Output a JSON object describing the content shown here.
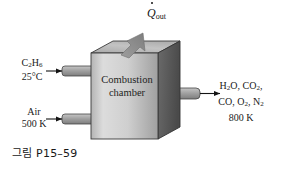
{
  "figure": {
    "caption": "그림 P15–59",
    "background_color": "#ffffff",
    "line_color": "#1a1a1a"
  },
  "chamber": {
    "label_line1": "Combustion",
    "label_line2": "chamber",
    "front_face_color_light": "#d8d8d8",
    "front_face_color_dark": "#9a9a9a",
    "top_face_color": "#b9b9b9",
    "side_face_color": "#5e5e5e",
    "edge_color": "#3a3a3a"
  },
  "inlets": [
    {
      "name": "fuel",
      "species_html": "C<sub>2</sub>H<sub>6</sub>",
      "species_text": "C2H6",
      "condition": "25°C",
      "pipe_color": "#9d9d9d"
    },
    {
      "name": "air",
      "species_html": "Air",
      "species_text": "Air",
      "condition": "500 K",
      "pipe_color": "#9d9d9d"
    }
  ],
  "outlet": {
    "name": "products",
    "line1_html": "H<sub>2</sub>O, CO<sub>2</sub>,",
    "line1_text": "H2O, CO2,",
    "line2_html": "CO, O<sub>2</sub>, N<sub>2</sub>",
    "line2_text": "CO, O2, N2",
    "condition": "800 K",
    "pipe_color": "#a5a5a5"
  },
  "heat": {
    "symbol": "Q",
    "subscript": "out",
    "label_text": "Q̇out",
    "arrow_color": "#8e8e8e",
    "arrow_direction": "up-right"
  }
}
